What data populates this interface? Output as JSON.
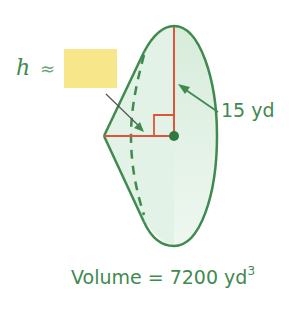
{
  "diagram": {
    "type": "cone",
    "height_label": {
      "variable": "h",
      "relation": "≈",
      "answer_box_color": "#f7e68a"
    },
    "radius_label": "15 yd",
    "volume_label": {
      "prefix": "Volume = 7200 yd",
      "exponent": "3"
    },
    "colors": {
      "outline": "#3f8a4f",
      "fill": "#e3f2e6",
      "height_radius_lines": "#e2543a",
      "text": "#3f8a4f",
      "arrow": "#3f8a4f"
    }
  }
}
